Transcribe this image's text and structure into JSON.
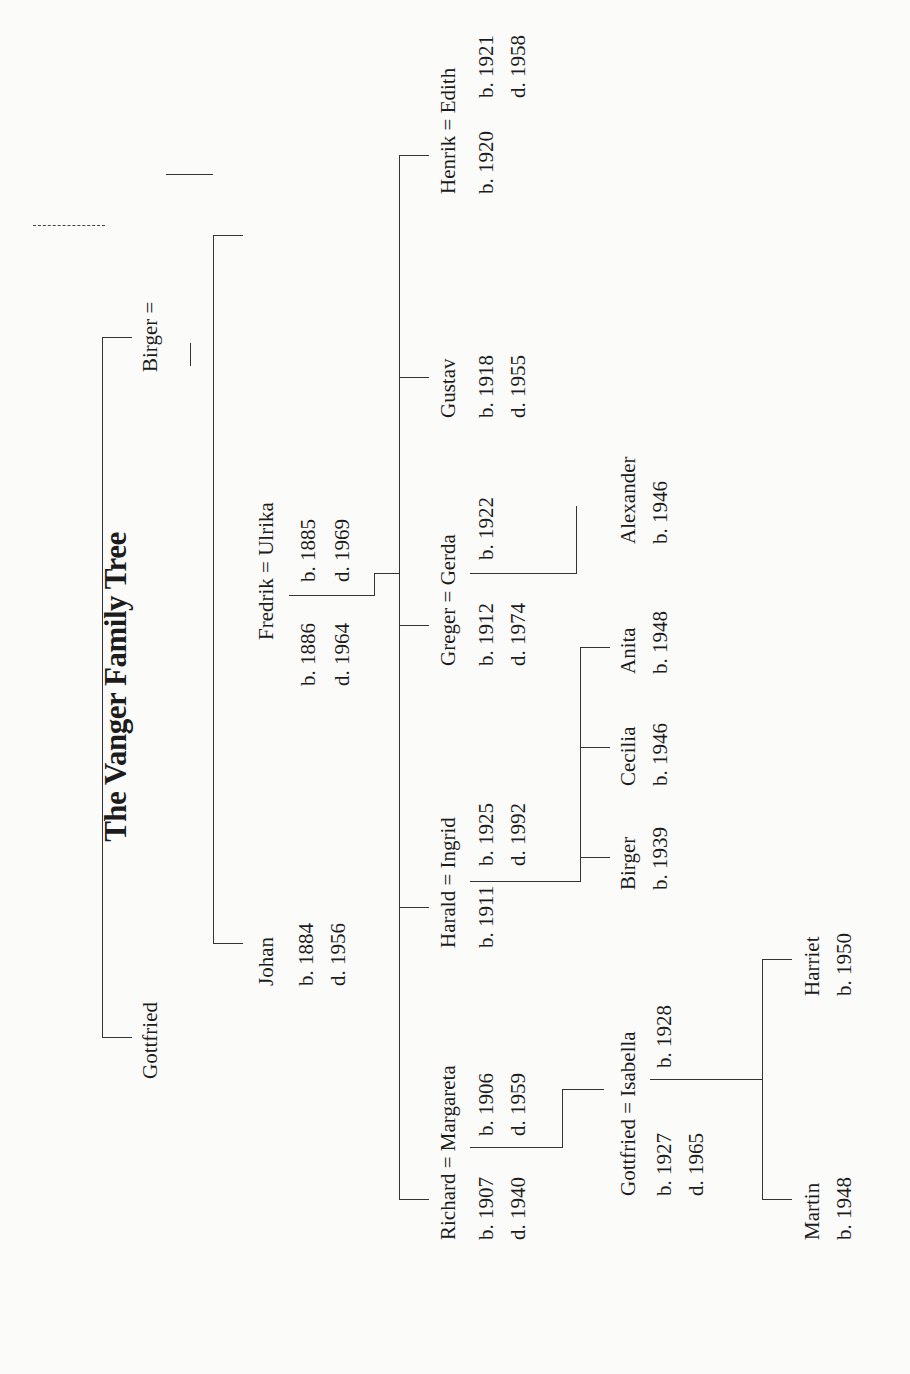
{
  "title": "The Vanger Family Tree",
  "gen1": {
    "gottfried": {
      "name": "Gottfried"
    },
    "birger": {
      "name": "Birger ="
    }
  },
  "gen2": {
    "johan": {
      "name": "Johan",
      "born": "b. 1884",
      "died": "d. 1956"
    },
    "fredrik": {
      "name": "Fredrik = Ulrika",
      "born": "b. 1886",
      "died": "d. 1964",
      "spouse_born": "b. 1885",
      "spouse_died": "d. 1969"
    }
  },
  "gen3": {
    "richard": {
      "name": "Richard = Margareta",
      "born": "b. 1907",
      "died": "d. 1940",
      "spouse_born": "b. 1906",
      "spouse_died": "d. 1959"
    },
    "harald": {
      "name": "Harald = Ingrid",
      "born": "b. 1911",
      "spouse_born": "b. 1925",
      "spouse_died": "d. 1992"
    },
    "greger": {
      "name": "Greger = Gerda",
      "born": "b. 1912",
      "died": "d. 1974",
      "spouse_born": "b. 1922"
    },
    "gustav": {
      "name": "Gustav",
      "born": "b. 1918",
      "died": "d. 1955"
    },
    "henrik": {
      "name": "Henrik = Edith",
      "born": "b. 1920",
      "spouse_born": "b. 1921",
      "spouse_died": "d. 1958"
    }
  },
  "gen4": {
    "gottfried": {
      "name": "Gottfried = Isabella",
      "born": "b. 1927",
      "died": "d. 1965",
      "spouse_born": "b. 1928"
    },
    "birger": {
      "name": "Birger",
      "born": "b. 1939"
    },
    "cecilia": {
      "name": "Cecilia",
      "born": "b. 1946"
    },
    "anita": {
      "name": "Anita",
      "born": "b. 1948"
    },
    "alexander": {
      "name": "Alexander",
      "born": "b. 1946"
    }
  },
  "gen5": {
    "martin": {
      "name": "Martin",
      "born": "b. 1948"
    },
    "harriet": {
      "name": "Harriet",
      "born": "b. 1950"
    }
  }
}
